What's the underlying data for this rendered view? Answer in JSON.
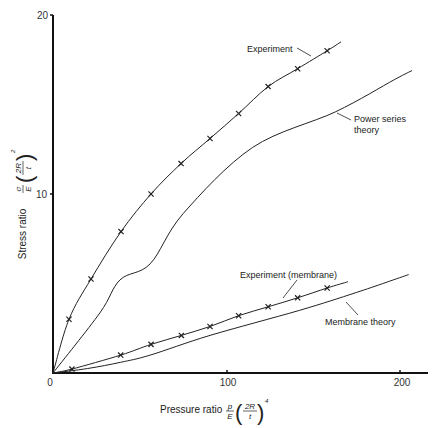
{
  "chart_data": {
    "type": "line",
    "title": "",
    "xlabel": "Pressure ratio p/E (2R/t)^4",
    "ylabel": "Stress ratio σ/E (2R/t)^2",
    "xlim": [
      0,
      215
    ],
    "ylim": [
      0,
      20
    ],
    "xticks": [
      0,
      100,
      200
    ],
    "yticks": [
      10,
      20
    ],
    "grid": false,
    "legend": "inline annotations",
    "series": [
      {
        "name": "Experiment",
        "style": "line with x markers",
        "x": [
          0,
          9.2,
          21.9,
          39.2,
          56.5,
          73.8,
          90.5,
          107,
          124,
          141,
          158,
          166
        ],
        "y": [
          0,
          3.0,
          5.25,
          7.9,
          10.0,
          11.7,
          13.1,
          14.5,
          16.0,
          17.0,
          18.0,
          18.5
        ],
        "markers": [
          [
            9.2,
            3.0
          ],
          [
            21.9,
            5.25
          ],
          [
            39.2,
            7.9
          ],
          [
            56.5,
            10.0
          ],
          [
            73.8,
            11.7
          ],
          [
            90.5,
            13.1
          ],
          [
            107,
            14.5
          ],
          [
            124,
            16.0
          ],
          [
            141,
            17.0
          ],
          [
            158,
            18.0
          ]
        ]
      },
      {
        "name": "Power series theory",
        "style": "line",
        "x": [
          0,
          27,
          38.6,
          56,
          75,
          115,
          163,
          197,
          207
        ],
        "y": [
          0,
          3.35,
          5.2,
          6.1,
          8.9,
          12.6,
          14.6,
          16.4,
          16.9
        ]
      },
      {
        "name": "Experiment (membrane)",
        "style": "line with x markers",
        "x": [
          0,
          10.9,
          39,
          56.5,
          74,
          90.5,
          107,
          124,
          141,
          158,
          170
        ],
        "y": [
          0,
          0.22,
          1.0,
          1.6,
          2.1,
          2.6,
          3.2,
          3.7,
          4.2,
          4.75,
          5.1
        ],
        "markers": [
          [
            10.9,
            0.22
          ],
          [
            39,
            1.0
          ],
          [
            56.5,
            1.6
          ],
          [
            74,
            2.1
          ],
          [
            90.5,
            2.6
          ],
          [
            107,
            3.2
          ],
          [
            124,
            3.7
          ],
          [
            141,
            4.2
          ],
          [
            158,
            4.75
          ]
        ]
      },
      {
        "name": "Membrane theory",
        "style": "line",
        "x": [
          0,
          20,
          39,
          56,
          90.5,
          142,
          175,
          205
        ],
        "y": [
          0,
          0.25,
          0.6,
          1.0,
          2.1,
          3.5,
          4.5,
          5.5
        ]
      }
    ],
    "annotations": [
      {
        "text": "Experiment",
        "series": "Experiment"
      },
      {
        "text": "Power series\ntheory",
        "series": "Power series theory"
      },
      {
        "text": "Experiment (membrane)",
        "series": "Experiment (membrane)"
      },
      {
        "text": "Membrane theory",
        "series": "Membrane theory"
      }
    ]
  },
  "axes": {
    "x_ticks": [
      "0",
      "100",
      "200"
    ],
    "y_ticks": [
      "10",
      "20"
    ],
    "x_label_text": "Pressure ratio",
    "y_label_text": "Stress ratio",
    "x_frac_num": "p",
    "x_frac_den": "E",
    "y_frac_num": "σ",
    "y_frac_den": "E",
    "paren_num": "2R",
    "paren_den": "t",
    "x_exponent": "4",
    "y_exponent": "2"
  },
  "labels": {
    "experiment": "Experiment",
    "power_series_1": "Power series",
    "power_series_2": "theory",
    "experiment_membrane": "Experiment (membrane)",
    "membrane_theory": "Membrane theory"
  },
  "colors": {
    "line": "#222222",
    "axis": "#111111",
    "background": "#ffffff"
  }
}
